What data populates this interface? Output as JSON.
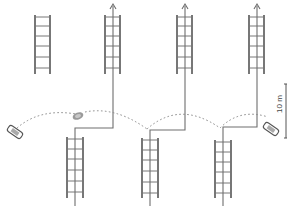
{
  "diagram": {
    "title": "",
    "scale_bar": {
      "label": "10 m",
      "length_m": 10
    },
    "colors": {
      "line": "#6e6e6e",
      "ladder_rail": "#555555",
      "ladder_rung": "#777777",
      "dotted_arc": "#8a8a8a",
      "vehicle": "#555555",
      "background": "#ffffff"
    },
    "ladders_top": [
      {
        "id": "top-1",
        "has_arrow": false
      },
      {
        "id": "top-2",
        "has_arrow": true
      },
      {
        "id": "top-3",
        "has_arrow": true
      },
      {
        "id": "top-4",
        "has_arrow": true
      }
    ],
    "ladders_bottom": [
      {
        "id": "bottom-1"
      },
      {
        "id": "bottom-2"
      },
      {
        "id": "bottom-3"
      }
    ],
    "vehicles": [
      {
        "id": "vehicle-left",
        "kind": "car-outline"
      },
      {
        "id": "vehicle-middle",
        "kind": "blurred-object"
      },
      {
        "id": "vehicle-right",
        "kind": "car-outline"
      }
    ],
    "icons": {
      "arrow": "arrow-up-icon",
      "ladder": "ladder-icon",
      "vehicle": "vehicle-icon"
    }
  }
}
